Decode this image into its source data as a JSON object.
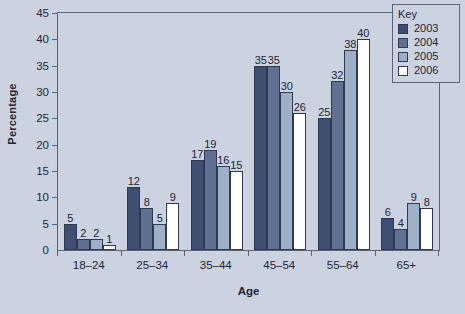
{
  "chart_data": {
    "type": "bar",
    "title": "",
    "xlabel": "Age",
    "ylabel": "Percentage",
    "categories": [
      "18–24",
      "25–34",
      "35–44",
      "45–54",
      "55–64",
      "65+"
    ],
    "series": [
      {
        "name": "2003",
        "color": "#3f4f73",
        "values": [
          5,
          12,
          17,
          35,
          25,
          6
        ]
      },
      {
        "name": "2004",
        "color": "#5f7093",
        "values": [
          2,
          8,
          19,
          35,
          32,
          4
        ]
      },
      {
        "name": "2005",
        "color": "#9eafc8",
        "values": [
          2,
          5,
          16,
          30,
          38,
          9
        ]
      },
      {
        "name": "2006",
        "color": "#ffffff",
        "values": [
          1,
          9,
          15,
          26,
          40,
          8
        ]
      }
    ],
    "ylim": [
      0,
      45
    ],
    "yticks": [
      0,
      5,
      10,
      15,
      20,
      25,
      30,
      35,
      40,
      45
    ],
    "ytick_labels": [
      "0",
      "5",
      "10",
      "15",
      "20",
      "25",
      "30",
      "35",
      "40",
      "45"
    ],
    "grid": false,
    "legend_position": "top-right",
    "legend_title": "Key",
    "bar_border_color": "#2f3a52",
    "axis_color": "#5a6378",
    "background_color": "#ccd3e0",
    "text_color": "#1d2433"
  }
}
